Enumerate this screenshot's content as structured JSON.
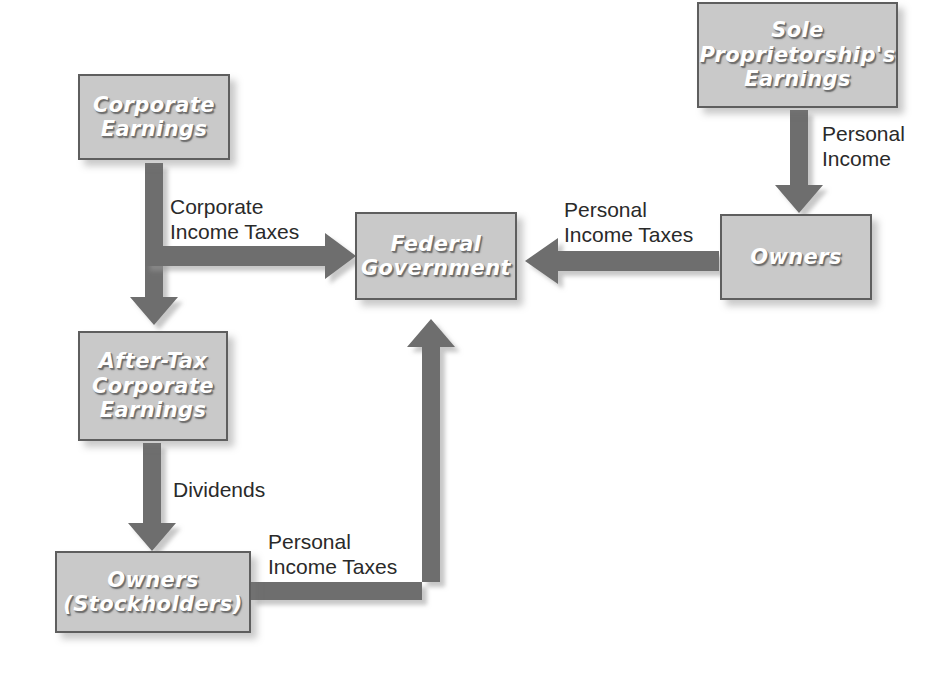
{
  "diagram": {
    "colors": {
      "box_fill": "#c9c9c9",
      "box_border": "#5e5e5e",
      "box_text": "#ffffff",
      "arrow": "#6e6e6e",
      "arrow_shadow": "#b9b9b9",
      "label_text": "#2a2a2a",
      "background": "#ffffff"
    },
    "nodes": [
      {
        "id": "corporate-earnings",
        "label": "Corporate\nEarnings",
        "x": 78,
        "y": 74,
        "w": 152,
        "h": 86,
        "font_size": 21
      },
      {
        "id": "after-tax-corporate-earnings",
        "label": "After-Tax\nCorporate\nEarnings",
        "x": 78,
        "y": 331,
        "w": 150,
        "h": 110,
        "font_size": 21
      },
      {
        "id": "owners-stockholders",
        "label": "Owners\n(Stockholders)",
        "x": 55,
        "y": 551,
        "w": 196,
        "h": 82,
        "font_size": 21
      },
      {
        "id": "federal-government",
        "label": "Federal\nGovernment",
        "x": 355,
        "y": 212,
        "w": 162,
        "h": 88,
        "font_size": 21
      },
      {
        "id": "owners",
        "label": "Owners",
        "x": 720,
        "y": 214,
        "w": 152,
        "h": 86,
        "font_size": 21
      },
      {
        "id": "sole-proprietorship-earnings",
        "label": "Sole\nProprietorship's\nEarnings",
        "x": 697,
        "y": 2,
        "w": 201,
        "h": 106,
        "font_size": 21
      }
    ],
    "edges": [
      {
        "id": "corporate-earnings-to-after-tax",
        "from": "corporate-earnings",
        "to": "after-tax-corporate-earnings",
        "label": "",
        "direction": "down"
      },
      {
        "id": "corporate-income-taxes",
        "from": "corporate-earnings",
        "to": "federal-government",
        "label": "Corporate\nIncome Taxes",
        "label_x": 170,
        "label_y": 195,
        "direction": "right"
      },
      {
        "id": "dividends",
        "from": "after-tax-corporate-earnings",
        "to": "owners-stockholders",
        "label": "Dividends",
        "label_x": 173,
        "label_y": 478,
        "direction": "down"
      },
      {
        "id": "stockholder-personal-income-taxes",
        "from": "owners-stockholders",
        "to": "federal-government",
        "label": "Personal\nIncome Taxes",
        "label_x": 268,
        "label_y": 530,
        "direction": "up"
      },
      {
        "id": "personal-income",
        "from": "sole-proprietorship-earnings",
        "to": "owners",
        "label": "Personal\nIncome",
        "label_x": 822,
        "label_y": 122,
        "direction": "down"
      },
      {
        "id": "owner-personal-income-taxes",
        "from": "owners",
        "to": "federal-government",
        "label": "Personal\nIncome Taxes",
        "label_x": 564,
        "label_y": 198,
        "direction": "left"
      }
    ]
  }
}
